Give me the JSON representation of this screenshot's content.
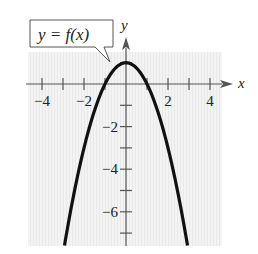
{
  "chart_data": {
    "type": "line",
    "title": "",
    "function_label": "y = f(x)",
    "xlabel": "x",
    "ylabel": "y",
    "xlim": [
      -4.5,
      4.5
    ],
    "ylim": [
      -7.6,
      1.5
    ],
    "grid": true,
    "x_ticks": [
      -4,
      -3,
      -2,
      -1,
      1,
      2,
      3,
      4
    ],
    "x_tick_labels": [
      {
        "value": -4,
        "text": "−4"
      },
      {
        "value": -2,
        "text": "−2"
      },
      {
        "value": 2,
        "text": "2"
      },
      {
        "value": 4,
        "text": "4"
      }
    ],
    "y_ticks": [
      -7,
      -6,
      -5,
      -4,
      -3,
      -2,
      -1,
      1
    ],
    "y_tick_labels": [
      {
        "value": -2,
        "text": "−2"
      },
      {
        "value": -4,
        "text": "−4"
      },
      {
        "value": -6,
        "text": "−6"
      }
    ],
    "series": [
      {
        "name": "f(x)",
        "expression": "1 - x^2",
        "x": [
          -2.93,
          -2.5,
          -2,
          -1.5,
          -1,
          -0.5,
          0,
          0.5,
          1,
          1.5,
          2,
          2.5,
          2.93
        ],
        "y": [
          -7.58,
          -5.25,
          -3,
          -1.25,
          0,
          0.75,
          1,
          0.75,
          0,
          -1.25,
          -3,
          -5.25,
          -7.58
        ]
      }
    ]
  },
  "colors": {
    "curve": "#111111",
    "axis": "#555555",
    "grid_bg": "#f1f1f1",
    "text": "#222222"
  }
}
